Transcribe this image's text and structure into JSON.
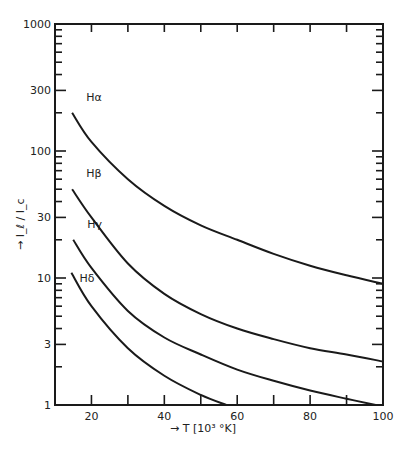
{
  "chart_data": {
    "type": "line",
    "title": "",
    "xlabel": "→ T  [10³ °K]",
    "ylabel": "→ I_ℓ / I_c",
    "xlim": [
      10,
      100
    ],
    "ylim": [
      1,
      1000
    ],
    "yscale": "log",
    "grid": false,
    "x_ticks": [
      20,
      40,
      60,
      80,
      100
    ],
    "x_tick_labels": [
      "20",
      "40",
      "60",
      "80",
      "100"
    ],
    "x_minor_ticks": [
      30,
      50,
      70,
      90
    ],
    "y_ticks": [
      1,
      3,
      10,
      30,
      100,
      300,
      1000
    ],
    "y_tick_labels": [
      "1",
      "3",
      "10",
      "30",
      "100",
      "300",
      "1000"
    ],
    "series": [
      {
        "name": "Hα",
        "x": [
          14.7,
          20,
          30,
          40,
          50,
          60,
          70,
          80,
          90,
          100
        ],
        "values": [
          200,
          118,
          60,
          37,
          26,
          20,
          15.5,
          12.5,
          10.5,
          9
        ]
      },
      {
        "name": "Hβ",
        "x": [
          14.7,
          20,
          30,
          40,
          50,
          60,
          70,
          80,
          90,
          100
        ],
        "values": [
          50,
          30,
          13,
          7.5,
          5.2,
          4,
          3.3,
          2.8,
          2.5,
          2.2
        ]
      },
      {
        "name": "Hγ",
        "x": [
          15,
          20,
          30,
          40,
          50,
          60,
          70,
          80,
          90,
          98
        ],
        "values": [
          20,
          12,
          5.5,
          3.4,
          2.5,
          1.9,
          1.55,
          1.3,
          1.12,
          1
        ]
      },
      {
        "name": "Hδ",
        "x": [
          14.5,
          20,
          30,
          40,
          50,
          57
        ],
        "values": [
          11,
          6,
          2.8,
          1.7,
          1.2,
          1
        ]
      }
    ]
  }
}
